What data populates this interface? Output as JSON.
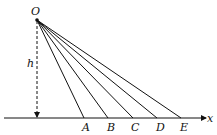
{
  "diagram": {
    "origin_label": "O",
    "height_label": "h",
    "axis_label": "x",
    "points": [
      {
        "label": "A",
        "x": 84
      },
      {
        "label": "B",
        "x": 108
      },
      {
        "label": "C",
        "x": 133
      },
      {
        "label": "D",
        "x": 157
      },
      {
        "label": "E",
        "x": 181
      }
    ],
    "line_color": "#111111"
  }
}
